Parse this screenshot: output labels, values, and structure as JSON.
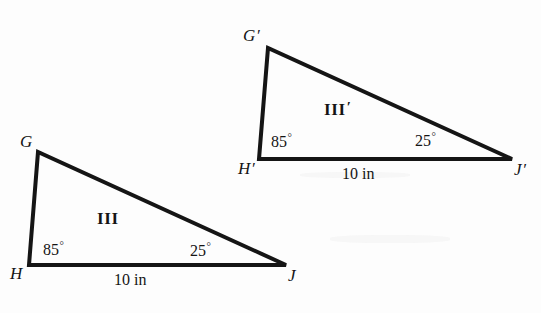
{
  "figure": {
    "type": "geometry-diagram",
    "stroke_color": "#151515",
    "background_color": "#fdfdfd",
    "stroke_width": 4
  },
  "triangles": [
    {
      "id": "triangle-lower",
      "region_label": "III",
      "region_prime": "",
      "vertices": [
        {
          "name": "G",
          "prime": "",
          "x": 38,
          "y": 152
        },
        {
          "name": "H",
          "prime": "",
          "x": 29,
          "y": 265
        },
        {
          "name": "J",
          "prime": "",
          "x": 286,
          "y": 265
        }
      ],
      "vertex_label_positions": [
        {
          "name": "G",
          "x": 20,
          "y": 133
        },
        {
          "name": "H",
          "x": 10,
          "y": 265
        },
        {
          "name": "J",
          "x": 288,
          "y": 267
        }
      ],
      "angles": [
        {
          "at": "H",
          "value": "85",
          "unit": "°",
          "x": 43,
          "y": 240
        },
        {
          "at": "J",
          "value": "25",
          "unit": "°",
          "x": 190,
          "y": 241
        }
      ],
      "sides": [
        {
          "from": "H",
          "to": "J",
          "length": "10 in",
          "x": 114,
          "y": 272
        }
      ],
      "region_label_position": {
        "x": 97,
        "y": 210
      }
    },
    {
      "id": "triangle-upper",
      "region_label": "III",
      "region_prime": "′",
      "vertices": [
        {
          "name": "G",
          "prime": "′",
          "x": 268,
          "y": 48
        },
        {
          "name": "H",
          "prime": "′",
          "x": 259,
          "y": 159
        },
        {
          "name": "J",
          "prime": "′",
          "x": 512,
          "y": 159
        }
      ],
      "vertex_label_positions": [
        {
          "name": "G",
          "x": 243,
          "y": 27
        },
        {
          "name": "H",
          "x": 238,
          "y": 160
        },
        {
          "name": "J",
          "x": 514,
          "y": 161
        }
      ],
      "angles": [
        {
          "at": "H",
          "value": "85",
          "unit": "°",
          "x": 271,
          "y": 132
        },
        {
          "at": "J",
          "value": "25",
          "unit": "°",
          "x": 415,
          "y": 131
        }
      ],
      "sides": [
        {
          "from": "H",
          "to": "J",
          "length": "10 in",
          "x": 342,
          "y": 166
        }
      ],
      "region_label_position": {
        "x": 324,
        "y": 100
      }
    }
  ],
  "labels": {
    "lower_vertex_g": "G",
    "lower_vertex_h": "H",
    "lower_vertex_j": "J",
    "lower_region": "III",
    "lower_angle_h": "85",
    "lower_angle_j": "25",
    "lower_side_hj": "10 in",
    "upper_vertex_g": "G",
    "upper_vertex_h": "H",
    "upper_vertex_j": "J",
    "upper_region": "III",
    "upper_angle_h": "85",
    "upper_angle_j": "25",
    "upper_side_hj": "10 in",
    "prime": "′",
    "degree": "°"
  }
}
